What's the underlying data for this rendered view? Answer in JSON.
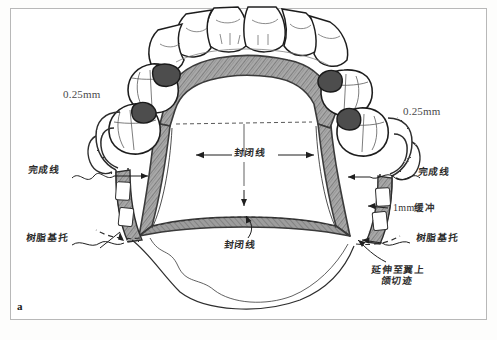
{
  "figure": {
    "letter": "a",
    "caption_language": "zh-Hans",
    "style": "hand-drawn pencil illustration, grayscale"
  },
  "labels": {
    "thickness_left": "0.25mm",
    "thickness_right": "0.25mm",
    "finish_line_left": "完成线",
    "finish_line_right": "完成线",
    "resin_base_left": "树脂基托",
    "resin_base_right": "树脂基托",
    "relief_right": "1mm缓冲",
    "relief_right_value": "1mm",
    "relief_right_cjk": "缓冲",
    "seal_line_upper": "封闭线",
    "seal_line_lower": "封闭线",
    "extend_notch_line1": "延伸至翼上",
    "extend_notch_line2": "颌切迹"
  },
  "colors": {
    "frame_border": "#b8b8b8",
    "page_background": "#ffffff",
    "ink": "#2b2b2b",
    "metal_shade": "#8d8d8d",
    "tooth_fill": "#ffffff",
    "label_text": "#333333"
  }
}
